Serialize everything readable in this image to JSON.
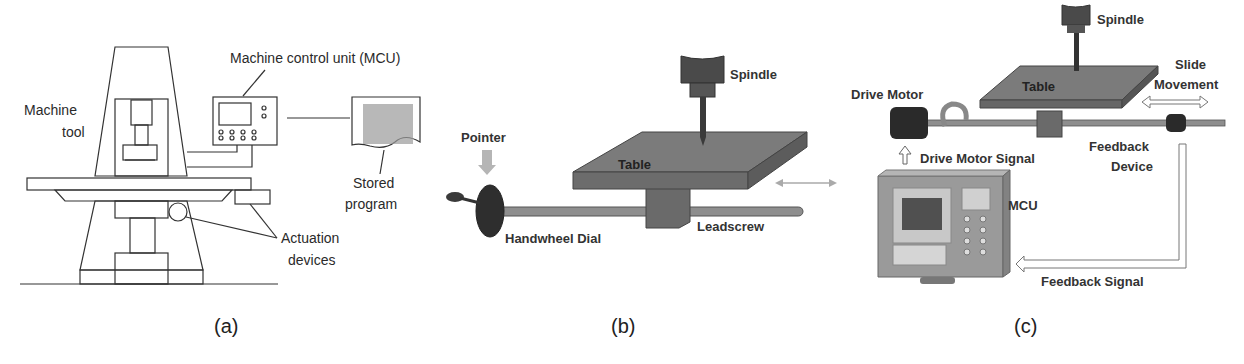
{
  "panel_a": {
    "caption": "(a)",
    "labels": {
      "machine_tool": "Machine",
      "machine_tool_2": "tool",
      "mcu": "Machine control unit (MCU)",
      "stored_program": "Stored",
      "stored_program_2": "program",
      "actuation": "Actuation",
      "actuation_2": "devices"
    }
  },
  "panel_b": {
    "caption": "(b)",
    "labels": {
      "spindle": "Spindle",
      "pointer": "Pointer",
      "table": "Table",
      "handwheel": "Handwheel Dial",
      "leadscrew": "Leadscrew"
    }
  },
  "panel_c": {
    "caption": "(c)",
    "labels": {
      "spindle": "Spindle",
      "slide": "Slide",
      "movement": "Movement",
      "drive_motor": "Drive Motor",
      "table": "Table",
      "drive_motor_signal": "Drive Motor Signal",
      "feedback_device": "Feedback",
      "feedback_device_2": "Device",
      "mcu": "MCU",
      "feedback_signal": "Feedback Signal"
    }
  },
  "colors": {
    "line": "#333333",
    "metal": "#7a7a7a",
    "dark": "#3a3a3a",
    "mcu_body": "#9a9a9a"
  }
}
